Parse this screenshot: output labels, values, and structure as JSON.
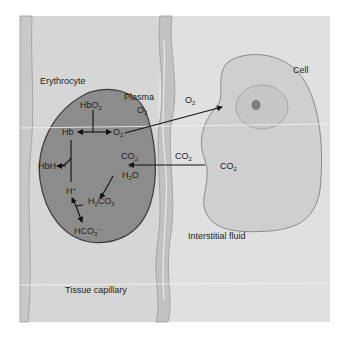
{
  "figure": {
    "colors": {
      "background": "#ffffff",
      "capillary_lumen": "#dadada",
      "capillary_wall": "#c4c4c4",
      "capillary_wall_edge": "#9a9a9a",
      "interstitial_fluid": "#e0e0e0",
      "erythrocyte_fill": "#8c8c8c",
      "erythrocyte_edge": "#3a3a3a",
      "cell_fill": "#cfcfcf",
      "cell_edge": "#8a8a8a",
      "nucleus_fill": "#c6c6c6",
      "nucleolus_fill": "#7d7d7d",
      "arrow": "#111111",
      "text": "#222222"
    },
    "regions": {
      "erythrocyte": "Erythrocyte",
      "plasma": "Plasma",
      "cell": "Cell",
      "interstitial_fluid": "Interstitial fluid",
      "tissue_capillary": "Tissue capillary"
    },
    "species": {
      "hbo2": {
        "base": "HbO",
        "sub": "2"
      },
      "hb": "Hb",
      "o2_rbc": {
        "base": "O",
        "sub": "2"
      },
      "hbh": "HbH",
      "h_plus": {
        "base": "H",
        "sup": "+"
      },
      "co2_rbc": {
        "base": "CO",
        "sub": "2"
      },
      "plus": "+",
      "h2o": {
        "pre": "H",
        "sub": "2",
        "post": "O"
      },
      "h2co3": {
        "pre": "H",
        "sub1": "2",
        "mid": "CO",
        "sub2": "3"
      },
      "hco3": {
        "base": "HCO",
        "sub": "3",
        "sup": "−"
      },
      "o2_plasma": {
        "base": "O",
        "sub": "2"
      },
      "o2_interstitial": {
        "base": "O",
        "sub": "2"
      },
      "co2_interstitial": {
        "base": "CO",
        "sub": "2"
      },
      "co2_cell": {
        "base": "CO",
        "sub": "2"
      }
    }
  }
}
